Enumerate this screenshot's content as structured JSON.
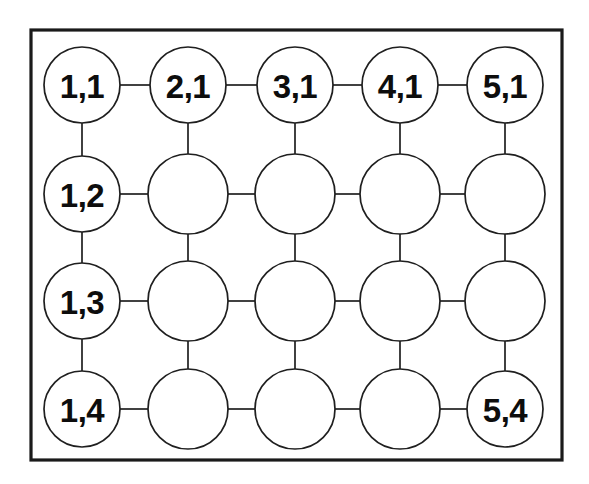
{
  "diagram": {
    "type": "grid-mesh",
    "background_color": "#ffffff",
    "stroke_color": "#1f1f1f",
    "frame_color": "#1a1a1a",
    "label_color": "#0d0d0d",
    "frame": {
      "x": 31,
      "y": 30,
      "width": 531,
      "height": 430,
      "stroke_width": 3.2
    },
    "grid": {
      "columns": 5,
      "rows": 4,
      "column_centers": [
        82,
        188,
        295,
        400,
        505
      ],
      "row_centers": [
        85,
        194,
        301,
        409
      ],
      "node_radius": 38
    },
    "nodes": [
      {
        "id": "n-1-1",
        "col": 1,
        "row": 1,
        "cx": 82,
        "cy": 85,
        "r": 38,
        "label": "1,1",
        "labeled": true
      },
      {
        "id": "n-2-1",
        "col": 2,
        "row": 1,
        "cx": 188,
        "cy": 85,
        "r": 38,
        "label": "2,1",
        "labeled": true
      },
      {
        "id": "n-3-1",
        "col": 3,
        "row": 1,
        "cx": 295,
        "cy": 85,
        "r": 38,
        "label": "3,1",
        "labeled": true
      },
      {
        "id": "n-4-1",
        "col": 4,
        "row": 1,
        "cx": 400,
        "cy": 85,
        "r": 38,
        "label": "4,1",
        "labeled": true
      },
      {
        "id": "n-5-1",
        "col": 5,
        "row": 1,
        "cx": 505,
        "cy": 85,
        "r": 38,
        "label": "5,1",
        "labeled": true
      },
      {
        "id": "n-1-2",
        "col": 1,
        "row": 2,
        "cx": 82,
        "cy": 194,
        "r": 38,
        "label": "1,2",
        "labeled": true
      },
      {
        "id": "n-2-2",
        "col": 2,
        "row": 2,
        "cx": 188,
        "cy": 194,
        "r": 40,
        "label": "",
        "labeled": false
      },
      {
        "id": "n-3-2",
        "col": 3,
        "row": 2,
        "cx": 295,
        "cy": 194,
        "r": 40,
        "label": "",
        "labeled": false
      },
      {
        "id": "n-4-2",
        "col": 4,
        "row": 2,
        "cx": 400,
        "cy": 194,
        "r": 40,
        "label": "",
        "labeled": false
      },
      {
        "id": "n-5-2",
        "col": 5,
        "row": 2,
        "cx": 505,
        "cy": 194,
        "r": 40,
        "label": "",
        "labeled": false
      },
      {
        "id": "n-1-3",
        "col": 1,
        "row": 3,
        "cx": 82,
        "cy": 301,
        "r": 38,
        "label": "1,3",
        "labeled": true
      },
      {
        "id": "n-2-3",
        "col": 2,
        "row": 3,
        "cx": 188,
        "cy": 301,
        "r": 40,
        "label": "",
        "labeled": false
      },
      {
        "id": "n-3-3",
        "col": 3,
        "row": 3,
        "cx": 295,
        "cy": 301,
        "r": 40,
        "label": "",
        "labeled": false
      },
      {
        "id": "n-4-3",
        "col": 4,
        "row": 3,
        "cx": 400,
        "cy": 301,
        "r": 40,
        "label": "",
        "labeled": false
      },
      {
        "id": "n-5-3",
        "col": 5,
        "row": 3,
        "cx": 505,
        "cy": 301,
        "r": 40,
        "label": "",
        "labeled": false
      },
      {
        "id": "n-1-4",
        "col": 1,
        "row": 4,
        "cx": 82,
        "cy": 409,
        "r": 38,
        "label": "1,4",
        "labeled": true
      },
      {
        "id": "n-2-4",
        "col": 2,
        "row": 4,
        "cx": 188,
        "cy": 409,
        "r": 40,
        "label": "",
        "labeled": false
      },
      {
        "id": "n-3-4",
        "col": 3,
        "row": 4,
        "cx": 295,
        "cy": 409,
        "r": 40,
        "label": "",
        "labeled": false
      },
      {
        "id": "n-4-4",
        "col": 4,
        "row": 4,
        "cx": 400,
        "cy": 409,
        "r": 40,
        "label": "",
        "labeled": false
      },
      {
        "id": "n-5-4",
        "col": 5,
        "row": 4,
        "cx": 505,
        "cy": 409,
        "r": 38,
        "label": "5,4",
        "labeled": true
      }
    ],
    "edges": [
      {
        "id": "e-h-1-1",
        "from": "n-1-1",
        "to": "n-2-1",
        "orientation": "horizontal"
      },
      {
        "id": "e-h-2-1",
        "from": "n-2-1",
        "to": "n-3-1",
        "orientation": "horizontal"
      },
      {
        "id": "e-h-3-1",
        "from": "n-3-1",
        "to": "n-4-1",
        "orientation": "horizontal"
      },
      {
        "id": "e-h-4-1",
        "from": "n-4-1",
        "to": "n-5-1",
        "orientation": "horizontal"
      },
      {
        "id": "e-h-1-2",
        "from": "n-1-2",
        "to": "n-2-2",
        "orientation": "horizontal"
      },
      {
        "id": "e-h-2-2",
        "from": "n-2-2",
        "to": "n-3-2",
        "orientation": "horizontal"
      },
      {
        "id": "e-h-3-2",
        "from": "n-3-2",
        "to": "n-4-2",
        "orientation": "horizontal"
      },
      {
        "id": "e-h-4-2",
        "from": "n-4-2",
        "to": "n-5-2",
        "orientation": "horizontal"
      },
      {
        "id": "e-h-1-3",
        "from": "n-1-3",
        "to": "n-2-3",
        "orientation": "horizontal"
      },
      {
        "id": "e-h-2-3",
        "from": "n-2-3",
        "to": "n-3-3",
        "orientation": "horizontal"
      },
      {
        "id": "e-h-3-3",
        "from": "n-3-3",
        "to": "n-4-3",
        "orientation": "horizontal"
      },
      {
        "id": "e-h-4-3",
        "from": "n-4-3",
        "to": "n-5-3",
        "orientation": "horizontal"
      },
      {
        "id": "e-h-1-4",
        "from": "n-1-4",
        "to": "n-2-4",
        "orientation": "horizontal"
      },
      {
        "id": "e-h-2-4",
        "from": "n-2-4",
        "to": "n-3-4",
        "orientation": "horizontal"
      },
      {
        "id": "e-h-3-4",
        "from": "n-3-4",
        "to": "n-4-4",
        "orientation": "horizontal"
      },
      {
        "id": "e-h-4-4",
        "from": "n-4-4",
        "to": "n-5-4",
        "orientation": "horizontal"
      },
      {
        "id": "e-v-1-1",
        "from": "n-1-1",
        "to": "n-1-2",
        "orientation": "vertical"
      },
      {
        "id": "e-v-1-2",
        "from": "n-1-2",
        "to": "n-1-3",
        "orientation": "vertical"
      },
      {
        "id": "e-v-1-3",
        "from": "n-1-3",
        "to": "n-1-4",
        "orientation": "vertical"
      },
      {
        "id": "e-v-2-1",
        "from": "n-2-1",
        "to": "n-2-2",
        "orientation": "vertical"
      },
      {
        "id": "e-v-2-2",
        "from": "n-2-2",
        "to": "n-2-3",
        "orientation": "vertical"
      },
      {
        "id": "e-v-2-3",
        "from": "n-2-3",
        "to": "n-2-4",
        "orientation": "vertical"
      },
      {
        "id": "e-v-3-1",
        "from": "n-3-1",
        "to": "n-3-2",
        "orientation": "vertical"
      },
      {
        "id": "e-v-3-2",
        "from": "n-3-2",
        "to": "n-3-3",
        "orientation": "vertical"
      },
      {
        "id": "e-v-3-3",
        "from": "n-3-3",
        "to": "n-3-4",
        "orientation": "vertical"
      },
      {
        "id": "e-v-4-1",
        "from": "n-4-1",
        "to": "n-4-2",
        "orientation": "vertical"
      },
      {
        "id": "e-v-4-2",
        "from": "n-4-2",
        "to": "n-4-3",
        "orientation": "vertical"
      },
      {
        "id": "e-v-4-3",
        "from": "n-4-3",
        "to": "n-4-4",
        "orientation": "vertical"
      },
      {
        "id": "e-v-5-1",
        "from": "n-5-1",
        "to": "n-5-2",
        "orientation": "vertical"
      },
      {
        "id": "e-v-5-2",
        "from": "n-5-2",
        "to": "n-5-3",
        "orientation": "vertical"
      },
      {
        "id": "e-v-5-3",
        "from": "n-5-3",
        "to": "n-5-4",
        "orientation": "vertical"
      }
    ],
    "label_font_size": 33
  }
}
